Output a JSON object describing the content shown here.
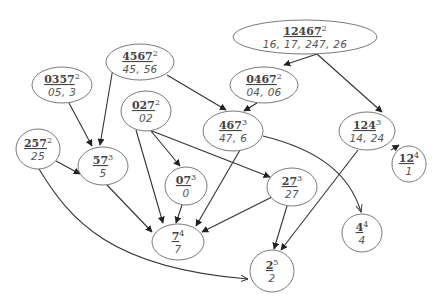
{
  "diagram": {
    "type": "directed-graph",
    "nodes": [
      {
        "id": "n12467",
        "label": "12467",
        "level": "2",
        "sub": "16, 17, 247, 26",
        "cx": 305,
        "cy": 37,
        "rx": 72,
        "ry": 17
      },
      {
        "id": "n4567",
        "label": "4567",
        "level": "2",
        "sub": "45, 56",
        "cx": 140,
        "cy": 62,
        "rx": 34,
        "ry": 18
      },
      {
        "id": "n0357",
        "label": "0357",
        "level": "2",
        "sub": "05, 3",
        "cx": 62,
        "cy": 85,
        "rx": 30,
        "ry": 18
      },
      {
        "id": "n0467",
        "label": "0467",
        "level": "2",
        "sub": "04, 06",
        "cx": 264,
        "cy": 85,
        "rx": 34,
        "ry": 18
      },
      {
        "id": "n027",
        "label": "027",
        "level": "2",
        "sub": "02",
        "cx": 146,
        "cy": 111,
        "rx": 25,
        "ry": 20
      },
      {
        "id": "n467",
        "label": "467",
        "level": "3",
        "sub": "47, 6",
        "cx": 233,
        "cy": 131,
        "rx": 30,
        "ry": 20
      },
      {
        "id": "n124",
        "label": "124",
        "level": "3",
        "sub": "14, 24",
        "cx": 367,
        "cy": 131,
        "rx": 28,
        "ry": 19
      },
      {
        "id": "n257",
        "label": "257",
        "level": "2",
        "sub": "25",
        "cx": 38,
        "cy": 149,
        "rx": 22,
        "ry": 20
      },
      {
        "id": "n57",
        "label": "57",
        "level": "3",
        "sub": "5",
        "cx": 103,
        "cy": 166,
        "rx": 25,
        "ry": 19
      },
      {
        "id": "n07",
        "label": "07",
        "level": "3",
        "sub": "0",
        "cx": 186,
        "cy": 186,
        "rx": 21,
        "ry": 19
      },
      {
        "id": "n27",
        "label": "27",
        "level": "3",
        "sub": "27",
        "cx": 292,
        "cy": 187,
        "rx": 25,
        "ry": 19
      },
      {
        "id": "n12",
        "label": "12",
        "level": "4",
        "sub": "1",
        "cx": 409,
        "cy": 164,
        "rx": 17,
        "ry": 18
      },
      {
        "id": "n4",
        "label": "4",
        "level": "4",
        "sub": "4",
        "cx": 362,
        "cy": 233,
        "rx": 20,
        "ry": 19
      },
      {
        "id": "n7",
        "label": "7",
        "level": "4",
        "sub": "7",
        "cx": 178,
        "cy": 242,
        "rx": 26,
        "ry": 18
      },
      {
        "id": "n2",
        "label": "2",
        "level": "5",
        "sub": "2",
        "cx": 272,
        "cy": 271,
        "rx": 22,
        "ry": 21
      }
    ],
    "edges": [
      {
        "from": "12467",
        "to": "0467",
        "d": "M 317 54 L 284 65",
        "head": "solid"
      },
      {
        "from": "12467",
        "to": "124",
        "d": "M 317 54 L 382 112",
        "head": "solid"
      },
      {
        "from": "4567",
        "to": "467",
        "d": "M 167 75 L 226 110",
        "head": "solid"
      },
      {
        "from": "4567",
        "to": "57",
        "d": "M 113 68 L 100 145",
        "head": "solid"
      },
      {
        "from": "0357",
        "to": "57",
        "d": "M 69 103 L 92 146",
        "head": "solid"
      },
      {
        "from": "0467",
        "to": "467",
        "d": "M 257 103 L 244 111",
        "head": "solid"
      },
      {
        "from": "027",
        "to": "07",
        "d": "M 151 131 L 180 166",
        "head": "solid"
      },
      {
        "from": "027",
        "to": "27",
        "d": "M 152 131 L 270 177",
        "head": "solid"
      },
      {
        "from": "027",
        "to": "7",
        "d": "M 136 130 L 163 223",
        "head": "solid"
      },
      {
        "from": "467",
        "to": "7",
        "d": "M 240 150 L 196 226",
        "head": "solid"
      },
      {
        "from": "467",
        "to": "4",
        "d": "M 263 136 C 320 150, 350 175, 361 212",
        "head": "open"
      },
      {
        "from": "257",
        "to": "57",
        "d": "M 56 161 L 80 174",
        "head": "solid"
      },
      {
        "from": "257",
        "to": "2",
        "d": "M 39 169 C 70 220, 110 268, 248 279",
        "head": "open"
      },
      {
        "from": "57",
        "to": "7",
        "d": "M 107 185 L 152 232",
        "head": "solid"
      },
      {
        "from": "07",
        "to": "7",
        "d": "M 182 205 L 176 223",
        "head": "solid"
      },
      {
        "from": "27",
        "to": "7",
        "d": "M 272 197 L 202 232",
        "head": "solid"
      },
      {
        "from": "27",
        "to": "2",
        "d": "M 287 206 L 274 249",
        "head": "solid"
      },
      {
        "from": "124",
        "to": "2",
        "d": "M 358 150 L 281 250",
        "head": "solid"
      },
      {
        "from": "124",
        "to": "12",
        "d": "M 391 150 L 399 145",
        "head": "solid"
      }
    ],
    "colors": {
      "background": "#ffffff",
      "node_stroke": "#6a6a6a",
      "edge_stroke": "#333333",
      "text": "#444444"
    }
  }
}
